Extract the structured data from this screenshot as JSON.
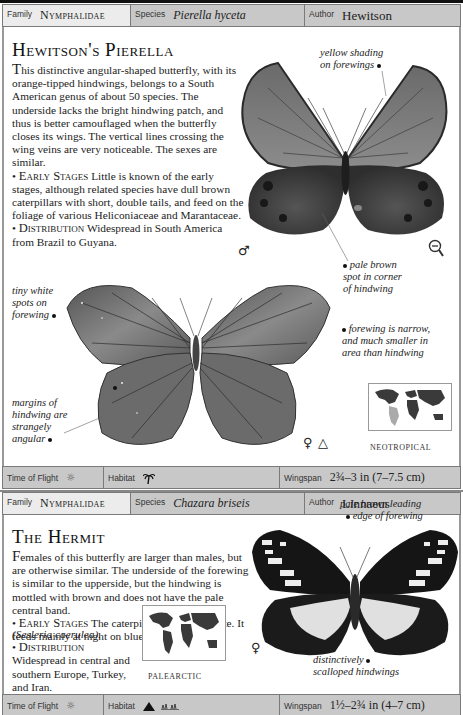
{
  "entries": [
    {
      "header": {
        "family_label": "Family",
        "family_value": "Nymphalidae",
        "species_label": "Species",
        "species_value": "Pierella hyceta",
        "author_label": "Author",
        "author_value": "Hewitson"
      },
      "title": "Hewitson's Pierella",
      "description": "his distinctive angular-shaped butterfly, with its orange-tipped hindwings, belongs to a South American genus of about 50 species. The underside lacks the bright hindwing patch, and thus is better camouflaged when the butterfly closes its wings. The vertical lines crossing the wing veins are very noticeable. The sexes are similar.",
      "description_initial": "T",
      "early_stages_label": "Early Stages",
      "early_stages_text": "Little is known of the early stages, although related species have dull brown caterpillars with short, double tails, and feed on the foliage of various Heliconiaceae and Marantaceae.",
      "distribution_label": "Distribution",
      "distribution_text": "Widespread in South America from Brazil to Guyana.",
      "annotations": {
        "yellow_shading": [
          "yellow shading",
          "on forewings"
        ],
        "pale_brown_spot": [
          "pale brown",
          "spot in corner",
          "of hindwing"
        ],
        "tiny_white_spots": [
          "tiny white",
          "spots on",
          "forewing"
        ],
        "forewing_narrow": [
          "forewing is narrow,",
          "and much smaller in",
          "area than hindwing"
        ],
        "margins": [
          "margins of",
          "hindwing are",
          "strangely",
          "angular"
        ]
      },
      "symbols": {
        "upperside_sex": "♂",
        "underside_sex": "♀",
        "underside_marker": "△"
      },
      "map_region": "NEOTROPICAL",
      "footer": {
        "time_of_flight_label": "Time of Flight",
        "habitat_label": "Habitat",
        "wingspan_label": "Wingspan",
        "wingspan_value": "2¾–3 in (7–7.5 cm)"
      }
    },
    {
      "header": {
        "family_label": "Family",
        "family_value": "Nymphalidae",
        "species_label": "Species",
        "species_value": "Chazara briseis",
        "author_label": "Author",
        "author_value": "Linnaeus"
      },
      "title": "The Hermit",
      "description": "emales of this butterfly are larger than males, but are otherwise similar. The underside of the forewing is similar to the upperside, but the hindwing is mottled with brown and does not have the pale central band.",
      "description_initial": "F",
      "early_stages_label": "Early Stages",
      "early_stages_text": "The caterpillar is grayish white. It feeds mainly at night on blue moor grass",
      "early_stages_italic": "(Sesleria caerulea).",
      "distribution_label": "Distribution",
      "distribution_text": "Widespread in central and southern Europe, Turkey, and Iran.",
      "annotations": {
        "pale_brown_leading": [
          "pale brown leading",
          "edge of forewing"
        ],
        "scalloped": [
          "distinctively",
          "scalloped hindwings"
        ]
      },
      "symbols": {
        "sex": "♀"
      },
      "map_region": "PALEARCTIC",
      "footer": {
        "time_of_flight_label": "Time of Flight",
        "habitat_label": "Habitat",
        "wingspan_label": "Wingspan",
        "wingspan_value": "1½–2¾ in (4–7 cm)"
      }
    }
  ]
}
